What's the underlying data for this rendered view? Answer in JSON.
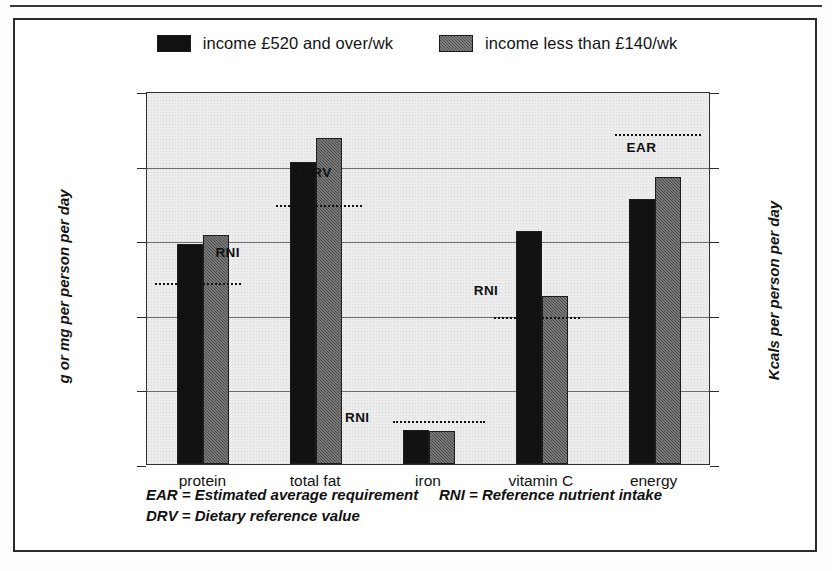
{
  "legend": {
    "entries": [
      {
        "label": "income £520 and over/wk",
        "swatch": "black-swatch",
        "color": "#121212"
      },
      {
        "label": "income less than £140/wk",
        "swatch": "gray-hatched-swatch",
        "color": "#4b4b4b"
      }
    ]
  },
  "axes": {
    "left_title": "g or mg per person per day",
    "right_title": "Kcals per person per day",
    "left_ticks": [
      "100",
      "80",
      "60",
      "40",
      "20",
      "0"
    ],
    "right_ticks": [
      "2,500",
      "2,000",
      "1,500",
      "1,000",
      "500",
      "0"
    ]
  },
  "footnotes": {
    "ear": "EAR = Estimated average requirement",
    "rni": "RNI = Reference nutrient intake",
    "drv": "DRV = Dietary reference value"
  },
  "reference_labels": {
    "protein": "RNI",
    "total_fat": "DRV",
    "iron": "RNI",
    "vitamin_c": "RNI",
    "energy": "EAR"
  },
  "chart_data": {
    "type": "bar",
    "title": "",
    "categories": [
      "protein",
      "total fat",
      "iron",
      "vitamin C",
      "energy"
    ],
    "series": [
      {
        "name": "income £520 and over/wk",
        "color": "#121212",
        "values": [
          59,
          81,
          9,
          62.5,
          71
        ]
      },
      {
        "name": "income less than £140/wk",
        "color": "#4b4b4b",
        "values": [
          61.5,
          87.5,
          8.8,
          45,
          77
        ]
      }
    ],
    "reference_lines": [
      {
        "category": "protein",
        "label": "RNI",
        "value": 49
      },
      {
        "category": "total fat",
        "label": "DRV",
        "value": 70
      },
      {
        "category": "iron",
        "label": "RNI",
        "value": 12
      },
      {
        "category": "vitamin C",
        "label": "RNI",
        "value": 40
      },
      {
        "category": "energy",
        "label": "EAR",
        "value": 89
      }
    ],
    "xlabel": "",
    "ylabel": "g or mg per person per day",
    "y2label": "Kcals per person per day",
    "ylim": [
      0,
      100
    ],
    "y2lim": [
      0,
      2500
    ],
    "ytick_step": 20,
    "y2tick_step": 500,
    "grid": true,
    "legend_position": "top-center",
    "note": "Left axis (g or mg) applies to protein, total fat, iron, vitamin C; right axis (Kcals) applies to energy."
  }
}
